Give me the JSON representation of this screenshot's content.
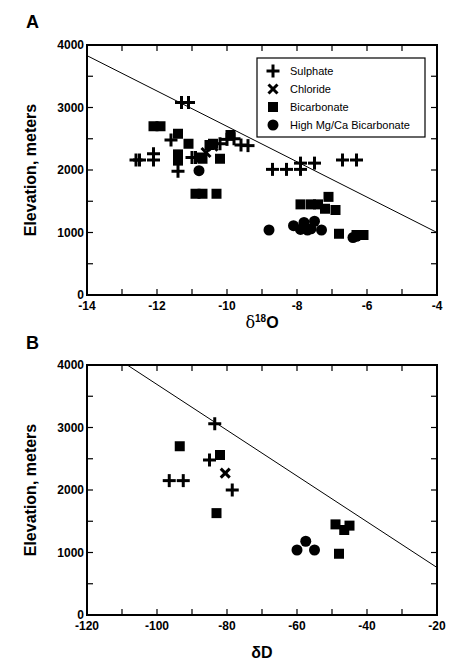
{
  "chart_data": [
    {
      "panel": "A",
      "type": "scatter",
      "title": "",
      "xlabel": "δ18O",
      "ylabel": "Elevation, meters",
      "xlim": [
        -14,
        -4
      ],
      "ylim": [
        0,
        4000
      ],
      "xticks": [
        -14,
        -12,
        -10,
        -8,
        -6,
        -4
      ],
      "yticks": [
        0,
        1000,
        2000,
        3000,
        4000
      ],
      "grid": false,
      "legend_position": "upper right",
      "legend": [
        "Sulphate",
        "Chloride",
        "Bicarbonate",
        "High Mg/Ca Bicarbonate"
      ],
      "line": {
        "x": [
          -14,
          -4
        ],
        "y": [
          3830,
          1000
        ]
      },
      "series": [
        {
          "name": "Sulphate",
          "marker": "plus",
          "points": [
            [
              -12.6,
              2160
            ],
            [
              -12.5,
              2160
            ],
            [
              -12.1,
              2160
            ],
            [
              -12.1,
              2260
            ],
            [
              -11.3,
              3080
            ],
            [
              -11.1,
              3080
            ],
            [
              -11.6,
              2480
            ],
            [
              -11.4,
              1980
            ],
            [
              -11.0,
              2200
            ],
            [
              -10.9,
              2200
            ],
            [
              -10.2,
              2420
            ],
            [
              -10.0,
              2490
            ],
            [
              -9.8,
              2500
            ],
            [
              -9.6,
              2400
            ],
            [
              -9.4,
              2390
            ],
            [
              -8.7,
              2010
            ],
            [
              -8.3,
              2010
            ],
            [
              -7.9,
              2010
            ],
            [
              -7.9,
              2110
            ],
            [
              -7.5,
              2110
            ],
            [
              -6.7,
              2160
            ],
            [
              -6.3,
              2160
            ]
          ]
        },
        {
          "name": "Chloride",
          "marker": "x",
          "points": [
            [
              -10.6,
              2280
            ],
            [
              -10.4,
              2380
            ]
          ]
        },
        {
          "name": "Bicarbonate",
          "marker": "square",
          "points": [
            [
              -12.1,
              2700
            ],
            [
              -11.9,
              2700
            ],
            [
              -11.4,
              2580
            ],
            [
              -11.4,
              2250
            ],
            [
              -11.4,
              2150
            ],
            [
              -11.1,
              2420
            ],
            [
              -10.8,
              2200
            ],
            [
              -10.7,
              2180
            ],
            [
              -10.5,
              2400
            ],
            [
              -10.4,
              2420
            ],
            [
              -10.2,
              2180
            ],
            [
              -9.9,
              2560
            ],
            [
              -10.9,
              1620
            ],
            [
              -10.7,
              1620
            ],
            [
              -10.3,
              1620
            ],
            [
              -7.9,
              1450
            ],
            [
              -7.6,
              1450
            ],
            [
              -7.4,
              1450
            ],
            [
              -7.1,
              1570
            ],
            [
              -7.2,
              1380
            ],
            [
              -6.9,
              1360
            ],
            [
              -6.8,
              980
            ],
            [
              -6.3,
              960
            ],
            [
              -6.1,
              960
            ]
          ]
        },
        {
          "name": "High Mg/Ca Bicarbonate",
          "marker": "circle",
          "points": [
            [
              -10.8,
              1990
            ],
            [
              -8.8,
              1040
            ],
            [
              -8.1,
              1110
            ],
            [
              -7.9,
              1050
            ],
            [
              -7.8,
              1160
            ],
            [
              -7.6,
              1060
            ],
            [
              -7.5,
              1180
            ],
            [
              -7.3,
              1040
            ],
            [
              -7.7,
              1040
            ],
            [
              -6.4,
              920
            ],
            [
              -6.3,
              940
            ]
          ]
        }
      ]
    },
    {
      "panel": "B",
      "type": "scatter",
      "title": "",
      "xlabel": "δD",
      "ylabel": "Elevation, meters",
      "xlim": [
        -120,
        -20
      ],
      "ylim": [
        0,
        4000
      ],
      "xticks": [
        -120,
        -100,
        -80,
        -60,
        -40,
        -20
      ],
      "yticks": [
        0,
        1000,
        2000,
        3000,
        4000
      ],
      "grid": false,
      "line": {
        "x": [
          -108.5,
          -20
        ],
        "y": [
          4000,
          760
        ]
      },
      "series": [
        {
          "name": "Sulphate",
          "marker": "plus",
          "points": [
            [
              -96.5,
              2150
            ],
            [
              -92.5,
              2150
            ],
            [
              -85.0,
              2480
            ],
            [
              -83.5,
              3060
            ],
            [
              -78.5,
              2000
            ]
          ]
        },
        {
          "name": "Chloride",
          "marker": "x",
          "points": [
            [
              -80.5,
              2270
            ]
          ]
        },
        {
          "name": "Bicarbonate",
          "marker": "square",
          "points": [
            [
              -93.5,
              2700
            ],
            [
              -82.0,
              2560
            ],
            [
              -83.0,
              1630
            ],
            [
              -49.0,
              1450
            ],
            [
              -46.5,
              1360
            ],
            [
              -45.0,
              1430
            ],
            [
              -48.0,
              980
            ]
          ]
        },
        {
          "name": "High Mg/Ca Bicarbonate",
          "marker": "circle",
          "points": [
            [
              -60.0,
              1040
            ],
            [
              -57.5,
              1180
            ],
            [
              -55.0,
              1040
            ]
          ]
        }
      ]
    }
  ],
  "panels": {
    "a": {
      "label": "A",
      "xlabel_delta": "δ",
      "xlabel_sup": "18",
      "xlabel_main": "O",
      "ylabel": "Elevation, meters",
      "xtick_labels": [
        "-14",
        "-12",
        "-10",
        "-8",
        "-6",
        "-4"
      ],
      "ytick_labels": [
        "0",
        "1000",
        "2000",
        "3000",
        "4000"
      ]
    },
    "b": {
      "label": "B",
      "xlabel": "δD",
      "ylabel": "Elevation, meters",
      "xtick_labels": [
        "-120",
        "-100",
        "-80",
        "-60",
        "-40",
        "-20"
      ],
      "ytick_labels": [
        "0",
        "1000",
        "2000",
        "3000",
        "4000"
      ]
    }
  },
  "legend": {
    "items": [
      {
        "label": "Sulphate",
        "marker": "plus-icon"
      },
      {
        "label": "Chloride",
        "marker": "x-icon"
      },
      {
        "label": "Bicarbonate",
        "marker": "square-icon"
      },
      {
        "label": "High Mg/Ca Bicarbonate",
        "marker": "circle-icon"
      }
    ]
  },
  "colors": {
    "ink": "#000000",
    "background": "#ffffff"
  }
}
